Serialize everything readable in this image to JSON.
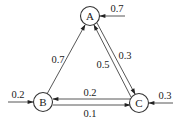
{
  "diagram": {
    "type": "state-transition-graph",
    "nodes": [
      {
        "id": "A",
        "label": "A"
      },
      {
        "id": "B",
        "label": "B"
      },
      {
        "id": "C",
        "label": "C"
      }
    ],
    "edges": [
      {
        "from": "B",
        "to": "A",
        "label": "0.7"
      },
      {
        "from": "C",
        "to": "A",
        "label": "0.5"
      },
      {
        "from": "A",
        "to": "C",
        "label": "0.3"
      },
      {
        "from": "C",
        "to": "B",
        "label": "0.2"
      },
      {
        "from": "B",
        "to": "C",
        "label": "0.1"
      }
    ],
    "inputs": [
      {
        "to": "A",
        "label": "0.7"
      },
      {
        "to": "B",
        "label": "0.2"
      },
      {
        "to": "C",
        "label": "0.3"
      }
    ]
  }
}
